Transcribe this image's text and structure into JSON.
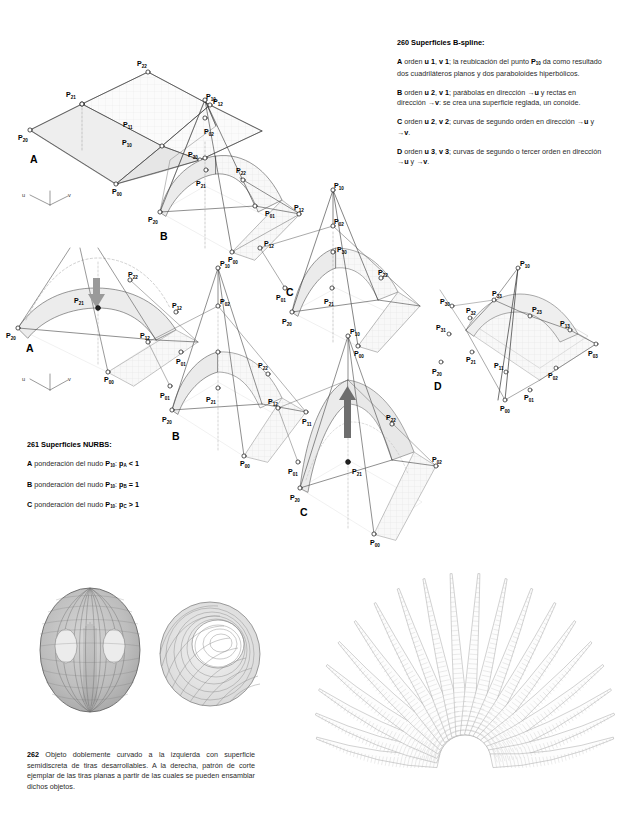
{
  "page": {
    "background": "#ffffff",
    "ink": "#1a1a1a",
    "accent_gray": "#8c8c8c"
  },
  "bspline_text": {
    "number": "260",
    "heading": "Superficies B-spline",
    "heading_suffix": ":",
    "entries": [
      {
        "letter": "A",
        "html": "orden <b>u 1</b>, <b>v 1</b>; la reubicación del punto <b>P<sub>10</sub></b> da como resultado dos cuadriláteros planos y dos paraboloides hiperbólicos."
      },
      {
        "letter": "B",
        "html": "orden <b>u 2</b>, <b>v 1</b>; parábolas en dirección →<b>u</b> y rectas en dirección →<b>v</b>: se crea una superficie reglada, un conoide."
      },
      {
        "letter": "C",
        "html": "orden <b>u 2</b>, <b>v 2</b>; curvas de segundo orden en dirección →<b>u</b> y →<b>v</b>."
      },
      {
        "letter": "D",
        "html": "orden <b>u 3</b>, <b>v 3</b>; curvas de segundo o tercer orden en dirección →<b>u</b> y →<b>v</b>."
      }
    ]
  },
  "nurbs_text": {
    "number": "261",
    "heading": "Superficies NURBS",
    "heading_suffix": ":",
    "entries": [
      {
        "letter": "A",
        "html": "ponderación del nudo <b>P<sub>10</sub></b>: <b>p<sub>A</sub> &lt; 1</b>"
      },
      {
        "letter": "B",
        "html": "ponderación del nudo <b>P<sub>10</sub></b>: <b>p<sub>B</sub> = 1</b>"
      },
      {
        "letter": "C",
        "html": "ponderación del nudo <b>P<sub>10</sub></b>: <b>p<sub>C</sub> &gt; 1</b>"
      }
    ]
  },
  "caption_262": {
    "number": "262",
    "text": "Objeto doblemente curvado a la izquierda con superficie semidiscreta de tiras desarrollables. A la derecha, patrón de corte ejemplar de las tiras planas a partir de las cuales se pueden ensamblar dichos objetos."
  },
  "figures": {
    "bspline": [
      {
        "id": "bspline-a",
        "letter": "A",
        "order_u": 1,
        "order_v": 1,
        "control_labels": [
          "P22",
          "P21",
          "P12",
          "P11",
          "P10",
          "P20",
          "P01",
          "P00"
        ],
        "has_axis_triad": true,
        "has_arrow": false
      },
      {
        "id": "bspline-b",
        "letter": "B",
        "order_u": 2,
        "order_v": 1,
        "control_labels": [
          "P10",
          "P02",
          "P30",
          "P21",
          "P22",
          "P12",
          "P20",
          "P01",
          "P00"
        ],
        "has_axis_triad": false,
        "has_arrow": false
      },
      {
        "id": "bspline-c",
        "letter": "C",
        "order_u": 2,
        "order_v": 2,
        "control_labels": [
          "P10",
          "P02",
          "P30",
          "P21",
          "P22",
          "P12",
          "P20",
          "P01",
          "P00"
        ],
        "has_axis_triad": false,
        "has_arrow": false
      },
      {
        "id": "bspline-d",
        "letter": "D",
        "order_u": 3,
        "order_v": 3,
        "control_labels": [
          "P10",
          "P33",
          "P32",
          "P23",
          "P13",
          "P31",
          "P21",
          "P11",
          "P03",
          "P02",
          "P01",
          "P00",
          "P30",
          "P20"
        ],
        "has_axis_triad": false,
        "has_arrow": false
      }
    ],
    "nurbs": [
      {
        "id": "nurbs-a",
        "letter": "A",
        "weight_symbol": "pA",
        "weight_relation": "< 1",
        "control_labels": [
          "P21",
          "P22",
          "P12",
          "P20",
          "P01",
          "P00"
        ],
        "has_axis_triad": true,
        "has_arrow": true,
        "arrow_direction": "down",
        "arrow_color": "#8c8c8c"
      },
      {
        "id": "nurbs-b",
        "letter": "B",
        "weight_symbol": "pB",
        "weight_relation": "= 1",
        "control_labels": [
          "P10",
          "P02",
          "P12",
          "P01",
          "P21",
          "P22",
          "P20",
          "P11",
          "P00"
        ],
        "has_axis_triad": false,
        "has_arrow": false
      },
      {
        "id": "nurbs-c",
        "letter": "C",
        "weight_symbol": "pC",
        "weight_relation": "> 1",
        "control_labels": [
          "P10",
          "P12",
          "P01",
          "P21",
          "P22",
          "P20",
          "P02",
          "P00"
        ],
        "has_axis_triad": false,
        "has_arrow": true,
        "arrow_direction": "up",
        "arrow_color": "#6e6e6e"
      }
    ],
    "objects_262": {
      "left_label": "objeto doblemente curvado (sombreado)",
      "right_label": "objeto de tiras (malla)",
      "pattern_label": "patrón de corte radial"
    }
  },
  "axis_triad": {
    "u": "u",
    "v": "v"
  }
}
